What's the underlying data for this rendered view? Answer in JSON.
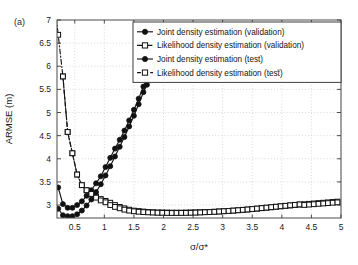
{
  "figure": {
    "panel_label": "(a)",
    "background_color": "#ffffff",
    "line_color": "#151515",
    "grid_color": "#c9c9c9"
  },
  "chart_data": {
    "type": "line",
    "title": "",
    "subtitle": "",
    "panel": "(a)",
    "xlabel": "σ/σ*",
    "ylabel": "ARMSE (m)",
    "xlim": [
      0.2,
      5.0
    ],
    "ylim": [
      2.72,
      7.0
    ],
    "xticks": [
      0.5,
      1,
      1.5,
      2,
      2.5,
      3,
      3.5,
      4,
      4.5,
      5
    ],
    "xtick_labels": [
      "0.5",
      "1",
      "1.5",
      "2",
      "2.5",
      "3",
      "3.5",
      "4",
      "4.5",
      "5"
    ],
    "yticks": [
      3,
      3.5,
      4,
      4.5,
      5,
      5.5,
      6,
      6.5,
      7
    ],
    "ytick_labels": [
      "3",
      "3.5",
      "4",
      "4.5",
      "5",
      "5.5",
      "6",
      "6.5",
      "7"
    ],
    "grid": true,
    "grid_style": "dotted",
    "legend_position": "top-right",
    "series": [
      {
        "name": "Joint density estimation (validation)",
        "marker": "filled-circle",
        "linestyle": "solid",
        "x": [
          0.22,
          0.3,
          0.38,
          0.46,
          0.54,
          0.62,
          0.7,
          0.78,
          0.86,
          0.94,
          1.02,
          1.1,
          1.18,
          1.26,
          1.34,
          1.42,
          1.5,
          1.58,
          1.66,
          1.72
        ],
        "y": [
          3.38,
          3.02,
          2.94,
          2.94,
          3.0,
          3.08,
          3.2,
          3.32,
          3.47,
          3.62,
          3.82,
          4.02,
          4.22,
          4.41,
          4.61,
          4.83,
          5.06,
          5.3,
          5.56,
          5.7
        ]
      },
      {
        "name": "Likelihood density estimation (validation)",
        "marker": "open-square",
        "linestyle": "dash-dot",
        "x": [
          0.22,
          0.3,
          0.38,
          0.46,
          0.54,
          0.62,
          0.7,
          0.78,
          0.86,
          0.94,
          1.02,
          1.1,
          1.18,
          1.26,
          1.34,
          1.42,
          1.5,
          1.58,
          1.66,
          1.74,
          1.82,
          1.9,
          1.98,
          2.06,
          2.14,
          2.22,
          2.3,
          2.38,
          2.46,
          2.54,
          2.62,
          2.7,
          2.78,
          2.86,
          2.94,
          3.02,
          3.1,
          3.18,
          3.26,
          3.34,
          3.42,
          3.5,
          3.58,
          3.66,
          3.74,
          3.82,
          3.9,
          3.98,
          4.06,
          4.14,
          4.22,
          4.3,
          4.38,
          4.46,
          4.54,
          4.62,
          4.7,
          4.78,
          4.86,
          4.94
        ],
        "y": [
          6.68,
          5.78,
          4.58,
          4.12,
          3.66,
          3.43,
          3.32,
          3.24,
          3.18,
          3.13,
          3.09,
          3.05,
          3.0,
          2.96,
          2.93,
          2.9,
          2.88,
          2.87,
          2.86,
          2.85,
          2.845,
          2.84,
          2.84,
          2.838,
          2.836,
          2.836,
          2.836,
          2.838,
          2.84,
          2.842,
          2.845,
          2.848,
          2.852,
          2.856,
          2.862,
          2.868,
          2.874,
          2.88,
          2.888,
          2.896,
          2.904,
          2.912,
          2.922,
          2.932,
          2.942,
          2.952,
          2.962,
          2.972,
          2.982,
          2.992,
          3.002,
          3.01,
          3.018,
          3.026,
          3.034,
          3.042,
          3.05,
          3.058,
          3.066,
          3.074
        ]
      },
      {
        "name": "Joint density estimation (test)",
        "marker": "filled-circle",
        "linestyle": "solid",
        "x": [
          0.22,
          0.3,
          0.38,
          0.46,
          0.54,
          0.62,
          0.7,
          0.78,
          0.86,
          0.94,
          1.02,
          1.1,
          1.18,
          1.26,
          1.34,
          1.42,
          1.5,
          1.58,
          1.66,
          1.72
        ],
        "y": [
          2.92,
          2.78,
          2.76,
          2.76,
          2.8,
          2.88,
          2.99,
          3.12,
          3.28,
          3.45,
          3.64,
          3.84,
          4.05,
          4.26,
          4.47,
          4.7,
          4.93,
          5.18,
          5.44,
          5.6
        ]
      },
      {
        "name": "Likelihood density estimation (test)",
        "marker": "open-square",
        "linestyle": "dashed",
        "x": [
          0.3,
          0.38,
          0.46,
          0.54,
          0.62,
          0.7,
          0.78,
          0.86,
          0.94,
          1.02,
          1.1,
          1.18,
          1.26,
          1.34,
          1.42,
          1.5,
          1.58,
          1.66,
          1.74,
          1.82,
          1.9,
          1.98,
          2.06,
          2.14,
          2.22,
          2.3,
          2.38,
          2.46,
          2.54,
          2.62,
          2.7,
          2.78,
          2.86,
          2.94,
          3.02,
          3.1,
          3.18,
          3.26,
          3.34,
          3.42,
          3.5,
          3.58,
          3.66,
          3.74,
          3.82,
          3.9,
          3.98,
          4.06,
          4.14,
          4.22,
          4.3,
          4.38,
          4.46,
          4.54,
          4.62,
          4.7,
          4.78,
          4.86,
          4.94
        ],
        "y": [
          5.78,
          4.58,
          4.12,
          3.66,
          3.43,
          3.32,
          3.24,
          3.16,
          3.1,
          3.06,
          3.0,
          2.96,
          2.93,
          2.9,
          2.88,
          2.865,
          2.855,
          2.848,
          2.842,
          2.838,
          2.834,
          2.832,
          2.83,
          2.829,
          2.829,
          2.83,
          2.831,
          2.833,
          2.836,
          2.84,
          2.844,
          2.848,
          2.854,
          2.86,
          2.866,
          2.872,
          2.88,
          2.888,
          2.896,
          2.904,
          2.914,
          2.924,
          2.934,
          2.944,
          2.954,
          2.964,
          2.974,
          2.984,
          2.994,
          3.004,
          3.014,
          3.002,
          3.01,
          3.018,
          3.026,
          3.034,
          3.042,
          3.05,
          3.058
        ]
      }
    ],
    "legend": [
      {
        "label": "Joint density estimation (validation)",
        "marker": "filled-circle",
        "linestyle": "solid"
      },
      {
        "label": "Likelihood density estimation (validation)",
        "marker": "open-square",
        "linestyle": "dash-dot"
      },
      {
        "label": "Joint density estimation (test)",
        "marker": "filled-circle",
        "linestyle": "solid"
      },
      {
        "label": "Likelihood density estimation (test)",
        "marker": "open-square",
        "linestyle": "dashed"
      }
    ]
  }
}
